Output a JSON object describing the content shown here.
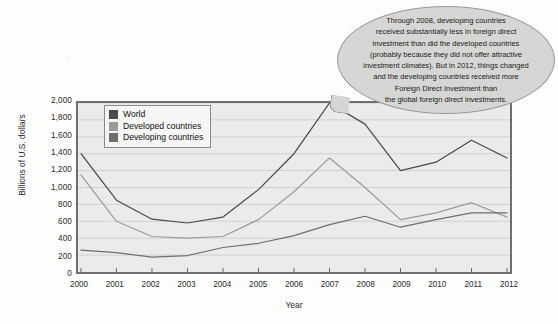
{
  "chart_data": {
    "type": "line",
    "title": "",
    "xlabel": "Year",
    "ylabel": "Billions of U.S. dollars",
    "categories": [
      "2000",
      "2001",
      "2002",
      "2003",
      "2004",
      "2005",
      "2006",
      "2007",
      "2008",
      "2009",
      "2010",
      "2011",
      "2012"
    ],
    "x": [
      2000,
      2001,
      2002,
      2003,
      2004,
      2005,
      2006,
      2007,
      2008,
      2009,
      2010,
      2011,
      2012
    ],
    "xlim": [
      2000,
      2012
    ],
    "ylim": [
      0,
      2000
    ],
    "yticks": [
      0,
      200,
      400,
      600,
      800,
      1000,
      1200,
      1400,
      1600,
      1800,
      2000
    ],
    "ytick_labels": [
      "0",
      "200",
      "400",
      "600",
      "800",
      "1,000",
      "1,200",
      "1,400",
      "1,600",
      "1,800",
      "2,000"
    ],
    "grid": true,
    "grid_axis": "y",
    "legend_position": "top-left inside plot",
    "series": [
      {
        "name": "World",
        "color": "#4a4a4a",
        "values": [
          1400,
          850,
          625,
          580,
          650,
          975,
          1400,
          2000,
          1750,
          1200,
          1300,
          1560,
          1350
        ]
      },
      {
        "name": "Developed countries",
        "color": "#9b9b9b",
        "values": [
          1150,
          600,
          420,
          400,
          420,
          620,
          950,
          1350,
          1000,
          620,
          700,
          820,
          650
        ]
      },
      {
        "name": "Developing countries",
        "color": "#6e6e6e",
        "values": [
          260,
          230,
          175,
          195,
          290,
          340,
          430,
          560,
          660,
          530,
          620,
          700,
          700
        ]
      }
    ],
    "annotations": [
      {
        "name": "callout-bubble",
        "text": "Through 2008, developing countries received substantially less in foreign direct investment than did the developed countries (probably because they did not offer attractive investment climates).  But in 2012, things changed and the developing countries received more Foreign Direct Investment than the global foreign direct investments."
      }
    ]
  },
  "legend": {
    "items": [
      {
        "label": "World",
        "color": "#4a4a4a"
      },
      {
        "label": "Developed countries",
        "color": "#9b9b9b"
      },
      {
        "label": "Developing countries",
        "color": "#6e6e6e"
      }
    ]
  },
  "axes": {
    "y_title": "Billions of U.S. dollars",
    "x_title": "Year"
  },
  "callout": {
    "text": "Through 2008, developing countries\nreceived substantially less in foreign direct\ninvestment than did the developed countries\n(probably because they did not offer attractive\ninvestment climates).  But in 2012, things changed\nand the developing countries received more\nForeign Direct Investment than\nthe global foreign direct investments."
  }
}
